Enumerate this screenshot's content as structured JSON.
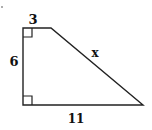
{
  "figure": {
    "type": "right trapezoid",
    "labels": {
      "top": "3",
      "left": "6",
      "slant": "x",
      "bottom": "11"
    },
    "right_angle_markers": 2,
    "stroke_color": "#222222"
  }
}
